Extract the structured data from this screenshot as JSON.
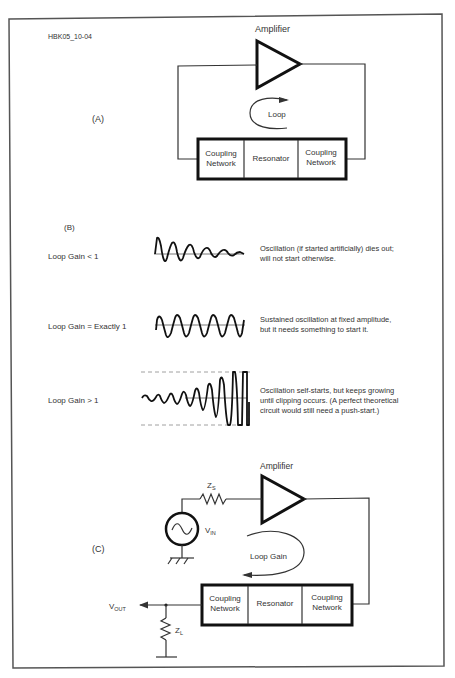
{
  "figure": {
    "id_label": "HBK05_10-04",
    "border_color": "#555555"
  },
  "panel_a": {
    "label": "(A)",
    "amplifier_label": "Amplifier",
    "loop_label": "Loop",
    "blocks": [
      "Coupling Network",
      "Resonator",
      "Coupling Network"
    ],
    "blocks_lines": [
      [
        "Coupling",
        "Network"
      ],
      [
        "Resonator"
      ],
      [
        "Coupling",
        "Network"
      ]
    ]
  },
  "panel_b": {
    "label": "(B)",
    "rows": [
      {
        "gain": "Loop Gain < 1",
        "waveform": "decaying",
        "description_lines": [
          "Oscillation (if started artificially) dies out;",
          "will not start otherwise."
        ]
      },
      {
        "gain": "Loop Gain = Exactly 1",
        "waveform": "sustained",
        "description_lines": [
          "Sustained oscillation at fixed amplitude,",
          "but it needs something to start it."
        ]
      },
      {
        "gain": "Loop Gain > 1",
        "waveform": "growing-clipped",
        "description_lines": [
          "Oscillation self-starts, but keeps growing",
          "until clipping occurs. (A perfect theoretical",
          "circuit would still need a push-start.)"
        ]
      }
    ]
  },
  "panel_c": {
    "label": "(C)",
    "amplifier_label": "Amplifier",
    "source_impedance": "Z",
    "source_impedance_sub": "S",
    "input_voltage": "V",
    "input_voltage_sub": "IN",
    "loop_label": "Loop Gain",
    "output_voltage": "V",
    "output_voltage_sub": "OUT",
    "load_impedance": "Z",
    "load_impedance_sub": "L",
    "blocks_lines": [
      [
        "Coupling",
        "Network"
      ],
      [
        "Resonator"
      ],
      [
        "Coupling",
        "Network"
      ]
    ]
  }
}
